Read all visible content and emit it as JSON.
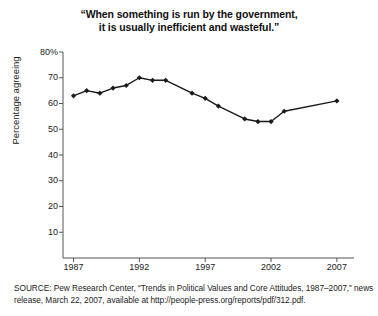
{
  "title": {
    "line1": "“When something is run by the government,",
    "line2": "it is usually inefficient and wasteful.”"
  },
  "source": {
    "line1": "SOURCE: Pew Research Center, “Trends in Political Values and Core Attitudes, 1987–2007,” news",
    "line2": "release, March 22, 2007, available at http://people-press.org/reports/pdf/312.pdf."
  },
  "chart_data": {
    "type": "line",
    "title": "“When something is run by the government, it is usually inefficient and wasteful.”",
    "xlabel": "",
    "ylabel": "Percentage agreeing",
    "xlim": [
      1986.2,
      2008.3
    ],
    "ylim": [
      0,
      80
    ],
    "ytick_labels": [
      "80%",
      "70",
      "60",
      "50",
      "40",
      "30",
      "20",
      "10"
    ],
    "ytick_values": [
      80,
      70,
      60,
      50,
      40,
      30,
      20,
      10
    ],
    "xtick_labels": [
      "1987",
      "1992",
      "1997",
      "2002",
      "2007"
    ],
    "xtick_values": [
      1987,
      1992,
      1997,
      2002,
      2007
    ],
    "grid": false,
    "legend": null,
    "line_color": "#1a1a1a",
    "marker": "diamond",
    "series": [
      {
        "name": "Percentage agreeing",
        "x": [
          1987,
          1988,
          1989,
          1990,
          1991,
          1992,
          1993,
          1994,
          1996,
          1997,
          1998,
          2000,
          2001,
          2002,
          2003,
          2007
        ],
        "values": [
          63,
          65,
          64,
          66,
          67,
          70,
          69,
          69,
          64,
          62,
          59,
          54,
          53,
          53,
          57,
          61
        ]
      }
    ]
  }
}
